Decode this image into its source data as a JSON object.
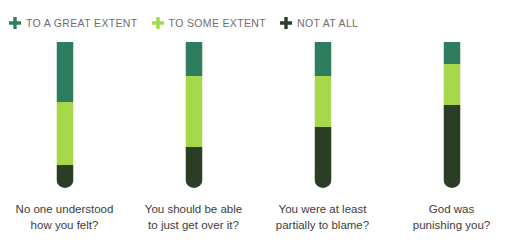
{
  "colors": {
    "great_extent": "#2E7D5E",
    "some_extent": "#A6D84A",
    "not_at_all": "#2C3D26",
    "legend_text": "#6d6e70",
    "caption_text": "#3c3c3c",
    "background": "#ffffff"
  },
  "legend": {
    "items": [
      {
        "label": "TO A GREAT EXTENT",
        "icon": "plus-icon",
        "color": "#2E7D5E"
      },
      {
        "label": "TO SOME EXTENT",
        "icon": "plus-icon",
        "color": "#A6D84A"
      },
      {
        "label": "NOT AT ALL",
        "icon": "plus-icon",
        "color": "#2C3D26"
      }
    ]
  },
  "chart_data": {
    "type": "bar",
    "title": "",
    "xlabel": "",
    "ylabel": "",
    "ylim": [
      0,
      100
    ],
    "grid": false,
    "stacked": true,
    "legend_position": "top-left",
    "categories": [
      "No one understood\nhow you felt?",
      "You should be able\nto just get over it?",
      "You were at least\npartially to blame?",
      "God was\npunishing you?"
    ],
    "series": [
      {
        "name": "TO A GREAT EXTENT",
        "color": "#2E7D5E",
        "values": [
          41,
          23,
          23,
          15
        ]
      },
      {
        "name": "TO SOME EXTENT",
        "color": "#A6D84A",
        "values": [
          43,
          48,
          35,
          28
        ]
      },
      {
        "name": "NOT AT ALL",
        "color": "#2C3D26",
        "values": [
          16,
          28,
          42,
          57
        ]
      }
    ],
    "bars": [
      {
        "caption": "No one understood\nhow you felt?",
        "segments": [
          {
            "series": "TO A GREAT EXTENT",
            "value": 41,
            "label": "41%",
            "color": "#2E7D5E"
          },
          {
            "series": "TO SOME EXTENT",
            "value": 43,
            "label": "43%",
            "color": "#A6D84A"
          },
          {
            "series": "NOT AT ALL",
            "value": 16,
            "label": "16%",
            "color": "#2C3D26"
          }
        ]
      },
      {
        "caption": "You should be able\nto just get over it?",
        "segments": [
          {
            "series": "TO A GREAT EXTENT",
            "value": 23,
            "label": "23%",
            "color": "#2E7D5E"
          },
          {
            "series": "TO SOME EXTENT",
            "value": 48,
            "label": "48%",
            "color": "#A6D84A"
          },
          {
            "series": "NOT AT ALL",
            "value": 28,
            "label": "28%",
            "color": "#2C3D26"
          }
        ]
      },
      {
        "caption": "You were at least\npartially to blame?",
        "segments": [
          {
            "series": "TO A GREAT EXTENT",
            "value": 23,
            "label": "23%",
            "color": "#2E7D5E"
          },
          {
            "series": "TO SOME EXTENT",
            "value": 35,
            "label": "35%",
            "color": "#A6D84A"
          },
          {
            "series": "NOT AT ALL",
            "value": 42,
            "label": "42%",
            "color": "#2C3D26"
          }
        ]
      },
      {
        "caption": "God was\npunishing you?",
        "segments": [
          {
            "series": "TO A GREAT EXTENT",
            "value": 15,
            "label": "15%",
            "color": "#2E7D5E"
          },
          {
            "series": "TO SOME EXTENT",
            "value": 28,
            "label": "28%",
            "color": "#A6D84A"
          },
          {
            "series": "NOT AT ALL",
            "value": 57,
            "label": "57%",
            "color": "#2C3D26"
          }
        ]
      }
    ]
  }
}
